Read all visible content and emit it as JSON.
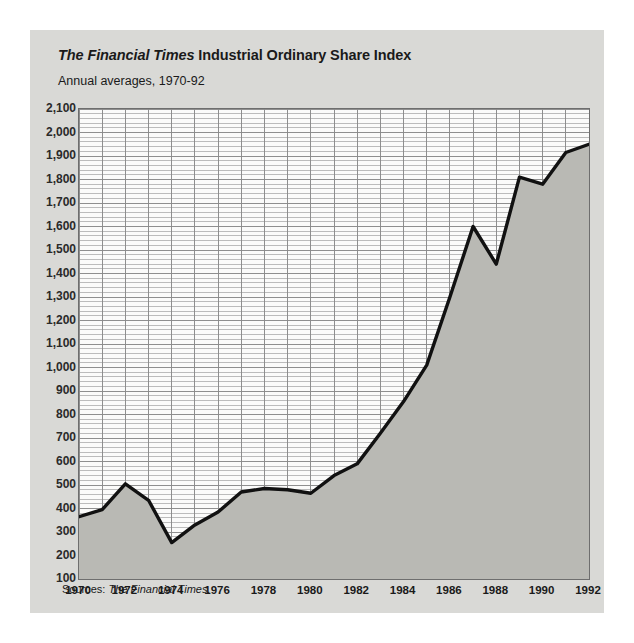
{
  "figure": {
    "title_italic": "The Financial Times",
    "title_rest": " Industrial Ordinary Share Index",
    "subtitle": "Annual averages, 1970-92",
    "source_label": "Sources:",
    "source_value": "The Financial Times.",
    "panel_color": "#d9d9d6",
    "plot_bg_color": "#fbfbfa",
    "fill_color": "#b9b9b4",
    "line_color": "#111111",
    "grid_color": "#8a8a8a"
  },
  "chart_data": {
    "type": "area",
    "title": "The Financial Times Industrial Ordinary Share Index",
    "subtitle": "Annual averages, 1970-92",
    "xlabel": "",
    "ylabel": "",
    "xlim": [
      1970,
      1992
    ],
    "ylim": [
      100,
      2100
    ],
    "ytick_step": 100,
    "yminor_step": 20,
    "xtick_step": 2,
    "grid": true,
    "legend": "none",
    "yticks": [
      "2,100",
      "2,000",
      "1,900",
      "1,800",
      "1,700",
      "1,600",
      "1,500",
      "1,400",
      "1,300",
      "1,200",
      "1,100",
      "1,000",
      "900",
      "800",
      "700",
      "600",
      "500",
      "400",
      "300",
      "200",
      "100"
    ],
    "ytick_values": [
      2100,
      2000,
      1900,
      1800,
      1700,
      1600,
      1500,
      1400,
      1300,
      1200,
      1100,
      1000,
      900,
      800,
      700,
      600,
      500,
      400,
      300,
      200,
      100
    ],
    "xticks": [
      "1970",
      "1972",
      "1974",
      "1976",
      "1978",
      "1980",
      "1982",
      "1984",
      "1986",
      "1988",
      "1990",
      "1992"
    ],
    "xtick_values": [
      1970,
      1972,
      1974,
      1976,
      1978,
      1980,
      1982,
      1984,
      1986,
      1988,
      1990,
      1992
    ],
    "x": [
      1970,
      1971,
      1972,
      1973,
      1974,
      1975,
      1976,
      1977,
      1978,
      1979,
      1980,
      1981,
      1982,
      1983,
      1984,
      1985,
      1986,
      1987,
      1988,
      1989,
      1990,
      1991,
      1992
    ],
    "values": [
      365,
      395,
      505,
      435,
      255,
      330,
      385,
      470,
      485,
      480,
      465,
      540,
      590,
      720,
      855,
      1010,
      1300,
      1600,
      1440,
      1810,
      1780,
      1915,
      1950
    ],
    "series": [
      {
        "name": "FT Industrial Ordinary Share Index",
        "values": [
          365,
          395,
          505,
          435,
          255,
          330,
          385,
          470,
          485,
          480,
          465,
          540,
          590,
          720,
          855,
          1010,
          1300,
          1600,
          1440,
          1810,
          1780,
          1915,
          1950
        ]
      }
    ]
  }
}
